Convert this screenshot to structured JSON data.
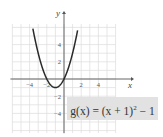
{
  "chart_data": {
    "type": "line",
    "title": "",
    "function_label": "g(x) = (x + 1)^2 − 1",
    "expression": "(x+1)^2-1",
    "xlabel": "x",
    "ylabel": "y",
    "xlim": [
      -6,
      6
    ],
    "ylim": [
      -6.3,
      6.4
    ],
    "x_ticks": [
      -4,
      -2,
      2,
      4
    ],
    "y_ticks": [
      4,
      2,
      -2,
      -4
    ],
    "x_tick_labels": [
      "−4",
      "−2",
      "2",
      "4"
    ],
    "y_tick_labels": [
      "4",
      "2",
      "−2",
      "−4"
    ],
    "grid": true,
    "vertex": [
      -1,
      -1
    ],
    "series": [
      {
        "name": "g(x)",
        "x": [
          -3.6,
          -3,
          -2.5,
          -2,
          -1.5,
          -1,
          -0.5,
          0,
          0.5,
          1,
          1.6
        ],
        "y": [
          5.76,
          3,
          1.25,
          0,
          -0.75,
          -1,
          -0.75,
          0,
          1.25,
          3,
          5.76
        ]
      }
    ]
  },
  "labels": {
    "x_axis": "x",
    "y_axis": "y",
    "eq_prefix": "g(x) = (x + 1)",
    "eq_exp": "2",
    "eq_suffix": " − 1"
  },
  "colors": {
    "curve": "#2a2a2a",
    "grid": "#dcdcdc",
    "axis": "#555555",
    "label_box": "#e2e2e2"
  }
}
